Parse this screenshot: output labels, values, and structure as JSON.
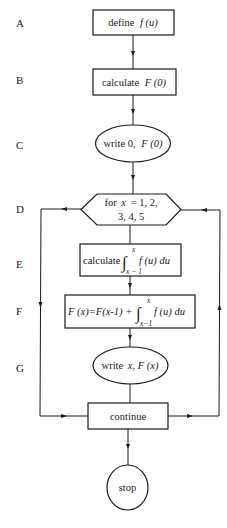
{
  "diagram": {
    "type": "flowchart",
    "row_labels": [
      "A",
      "B",
      "C",
      "D",
      "E",
      "F",
      "G"
    ],
    "nodes": {
      "A": {
        "shape": "rectangle",
        "text_plain": "define",
        "text_func": "f (u)"
      },
      "B": {
        "shape": "rectangle",
        "text_plain": "calculate",
        "text_func": "F (0)"
      },
      "C": {
        "shape": "ellipse",
        "text_plain": "write 0,",
        "text_func": "F (0)"
      },
      "D": {
        "shape": "hexagon",
        "line1_plain": "for",
        "line1_var": "x",
        "line1_rest": "= 1, 2,",
        "line2": "3, 4, 5"
      },
      "E": {
        "shape": "rectangle",
        "text_plain": "calculate",
        "integral_upper": "x",
        "integral_lower": "x − 1",
        "integrand": "f (u) du"
      },
      "F": {
        "shape": "rectangle",
        "lhs": "F (x)=F(x-1) +",
        "integral_upper": "x",
        "integral_lower": "x−1",
        "integrand": "f (u)  du"
      },
      "G": {
        "shape": "ellipse",
        "text_plain": "write",
        "text_func": "x,  F (x)"
      },
      "continue": {
        "shape": "rectangle",
        "text": "continue"
      },
      "stop": {
        "shape": "ellipse",
        "text": "stop"
      }
    },
    "edges": [
      {
        "from": "A",
        "to": "B"
      },
      {
        "from": "B",
        "to": "C"
      },
      {
        "from": "C",
        "to": "D"
      },
      {
        "from": "D",
        "to": "E"
      },
      {
        "from": "E",
        "to": "F"
      },
      {
        "from": "F",
        "to": "G"
      },
      {
        "from": "G",
        "to": "continue"
      },
      {
        "from": "D",
        "to": "continue",
        "route": "left loop"
      },
      {
        "from": "continue",
        "to": "D",
        "route": "right loop"
      },
      {
        "from": "continue",
        "to": "stop"
      }
    ],
    "integral_symbol": "∫"
  }
}
